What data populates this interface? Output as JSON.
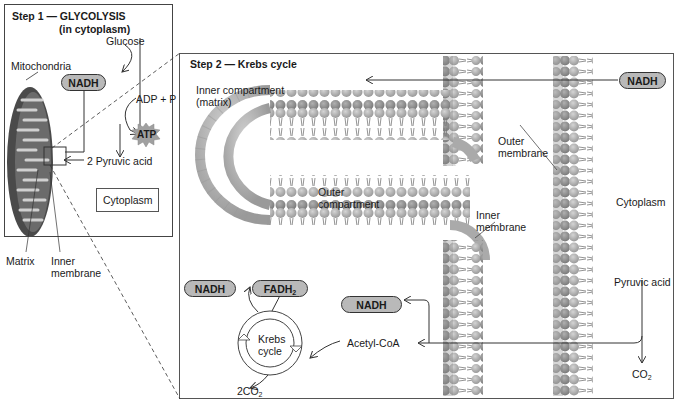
{
  "step1": {
    "title_line1": "Step 1 — GLYCOLYSIS",
    "title_line2": "(in cytoplasm)",
    "labels": {
      "glucose": "Glucose",
      "mitochondria": "Mitochondria",
      "nadh": "NADH",
      "adp_p": "ADP + P",
      "atp": "ATP",
      "pyruvic": "2 Pyruvic acid",
      "cytoplasm": "Cytoplasm",
      "matrix": "Matrix",
      "inner_membrane_1": "Inner",
      "inner_membrane_2": "membrane"
    }
  },
  "step2": {
    "title": "Step 2 — Krebs cycle",
    "labels": {
      "inner_compartment_1": "Inner compartment",
      "inner_compartment_2": "(matrix)",
      "outer_membrane_1": "Outer",
      "outer_membrane_2": "membrane",
      "outer_compartment_1": "Outer",
      "outer_compartment_2": "compartment",
      "inner_membrane_1": "Inner",
      "inner_membrane_2": "membrane",
      "cytoplasm": "Cytoplasm",
      "pyruvic": "Pyruvic acid",
      "co2": "CO",
      "co2_sub": "2",
      "acetyl_coa": "Acetyl-CoA",
      "krebs_1": "Krebs",
      "krebs_2": "cycle",
      "two_co2": "2CO",
      "two_co2_sub": "2",
      "nadh_top": "NADH",
      "nadh_mid": "NADH",
      "nadh_left": "NADH",
      "fadh": "FADH",
      "fadh_sub": "2"
    }
  },
  "colors": {
    "pill_fill": "#b9b9b9",
    "lipid_head": "#a8a8a8",
    "lipid_dark": "#8a8a8a",
    "mito_outer": "#5a5a5a",
    "mito_cristae": "#c8c8c8",
    "line": "#333333"
  }
}
